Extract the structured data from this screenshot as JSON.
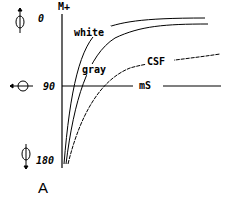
{
  "figure": {
    "panel_label": "A",
    "y_axis_label": "M+",
    "x_axis_label": "mS",
    "phase_ticks": [
      {
        "label": "0",
        "icon": "phase-arrow-up-icon"
      },
      {
        "label": "90",
        "icon": "phase-arrow-left-icon"
      },
      {
        "label": "180",
        "icon": "phase-arrow-down-icon"
      }
    ],
    "curves": [
      {
        "name": "white",
        "label": "white"
      },
      {
        "name": "gray",
        "label": "gray"
      },
      {
        "name": "csf",
        "label": "CSF"
      }
    ],
    "colors": {
      "line": "#000000",
      "background": "#ffffff"
    }
  }
}
